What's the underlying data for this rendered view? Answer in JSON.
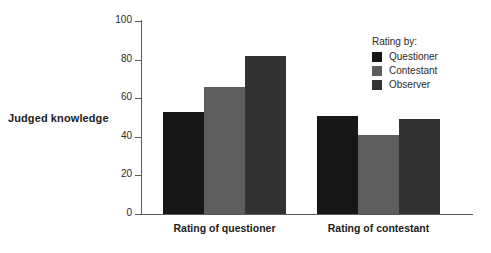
{
  "chart_data": {
    "type": "bar",
    "title": "",
    "xlabel": "",
    "ylabel": "Judged knowledge",
    "categories": [
      "Rating of questioner",
      "Rating of contestant"
    ],
    "series": [
      {
        "name": "Questioner",
        "values": [
          53,
          51
        ],
        "color": "#171717"
      },
      {
        "name": "Contestant",
        "values": [
          66,
          41
        ],
        "color": "#5e5e5e"
      },
      {
        "name": "Observer",
        "values": [
          82,
          49
        ],
        "color": "#323232"
      }
    ],
    "ylim": [
      0,
      100
    ],
    "yticks": [
      0,
      20,
      40,
      60,
      80,
      100
    ],
    "ytick_labels": [
      "0",
      "20",
      "40",
      "60",
      "80",
      "100"
    ],
    "grid": false,
    "legend_position": "top-right",
    "legend_title": "Rating by:"
  },
  "axes": {
    "y_title": "Judged knowledge",
    "axis_color": "#5a5a5a"
  },
  "legend": {
    "title": "Rating by:",
    "entries": [
      {
        "label": "Questioner",
        "color": "#171717"
      },
      {
        "label": "Contestant",
        "color": "#5e5e5e"
      },
      {
        "label": "Observer",
        "color": "#323232"
      }
    ]
  }
}
